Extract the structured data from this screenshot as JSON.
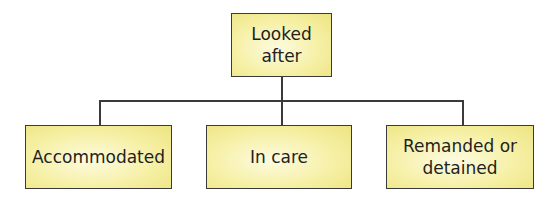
{
  "diagram": {
    "type": "hierarchy",
    "root": {
      "label": "Looked after"
    },
    "children": [
      {
        "label": "Accommodated"
      },
      {
        "label": "In care"
      },
      {
        "label": "Remanded or detained",
        "lines": [
          "Remanded or",
          "detained"
        ]
      }
    ],
    "colors": {
      "box_fill": "#f6f0a6",
      "box_border": "#3a3a3a",
      "text": "#231f20",
      "connector": "#3a3a3a"
    }
  }
}
